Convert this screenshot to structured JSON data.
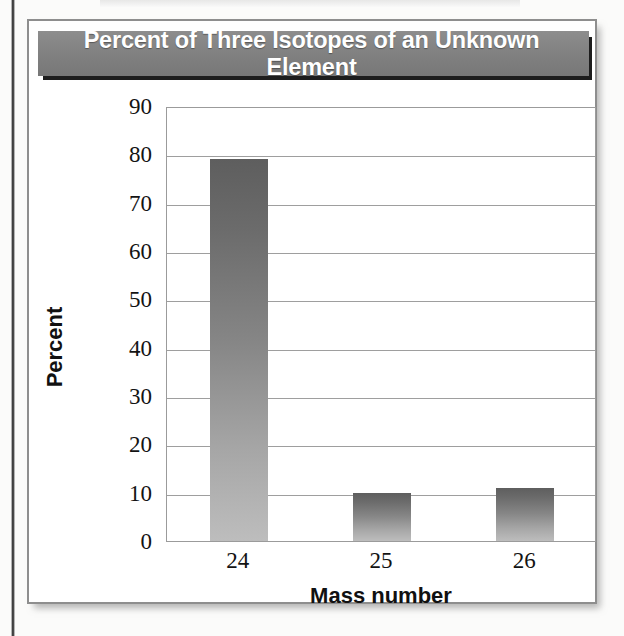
{
  "figure": {
    "title": "Percent of Three Isotopes of an Unknown Element"
  },
  "chart_data": {
    "type": "bar",
    "title": "Percent of Three Isotopes of an Unknown Element",
    "categories": [
      "24",
      "25",
      "26"
    ],
    "values": [
      79,
      10,
      11
    ],
    "xlabel": "Mass number",
    "ylabel": "Percent",
    "ylim": [
      0,
      90
    ],
    "ytick_step": 10,
    "yticks": [
      "90",
      "80",
      "70",
      "60",
      "50",
      "40",
      "30",
      "20",
      "10",
      "0"
    ],
    "grid": "horizontal",
    "legend": "none",
    "bar_color_top": "#5e5e5e",
    "bar_color_bottom": "#bdbdbd",
    "title_bar_color": "#828282",
    "title_text_color": "#ffffff",
    "gridline_color": "#9e9e9e"
  }
}
